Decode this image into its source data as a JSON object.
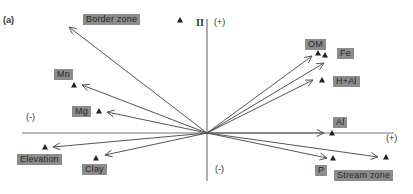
{
  "panel_label": "(a)",
  "axes": {
    "vertical_label": "II",
    "top": "(+)",
    "bottom": "(-)",
    "left": "(-)",
    "right": "(+)"
  },
  "vectors": [
    {
      "name": "Border zone",
      "point": [
        180,
        20
      ],
      "tip": [
        69,
        27
      ]
    },
    {
      "name": "Mn",
      "point": [
        74,
        85
      ],
      "tip": [
        82,
        85
      ]
    },
    {
      "name": "Mg",
      "point": [
        99,
        111
      ],
      "tip": [
        107,
        112
      ]
    },
    {
      "name": "Elevation",
      "point": [
        45,
        147
      ],
      "tip": [
        53,
        147
      ]
    },
    {
      "name": "Clay",
      "point": [
        96,
        158
      ],
      "tip": [
        105,
        155
      ]
    },
    {
      "name": "OM",
      "point": [
        318,
        53
      ],
      "tip": [
        312,
        56
      ]
    },
    {
      "name": "Fe",
      "point": [
        325,
        55
      ],
      "tip": [
        324,
        63
      ]
    },
    {
      "name": "H+Al",
      "point": [
        322,
        80
      ],
      "tip": [
        313,
        80
      ]
    },
    {
      "name": "Al",
      "point": [
        332,
        133
      ],
      "tip": [
        324,
        133
      ]
    },
    {
      "name": "P",
      "point": [
        333,
        158
      ],
      "tip": [
        327,
        158
      ]
    },
    {
      "name": "Stream zone",
      "point": [
        386,
        157
      ],
      "tip": [
        378,
        157
      ]
    }
  ],
  "labels": [
    {
      "text": "Border zone",
      "x": 83,
      "y": 14
    },
    {
      "text": "Mn",
      "x": 54,
      "y": 69
    },
    {
      "text": "Mg",
      "x": 72,
      "y": 106
    },
    {
      "text": "Elevation",
      "x": 17,
      "y": 154
    },
    {
      "text": "Clay",
      "x": 82,
      "y": 164
    },
    {
      "text": "OM",
      "x": 305,
      "y": 39
    },
    {
      "text": "Fe",
      "x": 337,
      "y": 48
    },
    {
      "text": "H+Al",
      "x": 333,
      "y": 76
    },
    {
      "text": "Al",
      "x": 333,
      "y": 117
    },
    {
      "text": "P",
      "x": 315,
      "y": 165
    },
    {
      "text": "Stream zone",
      "x": 334,
      "y": 170
    }
  ]
}
